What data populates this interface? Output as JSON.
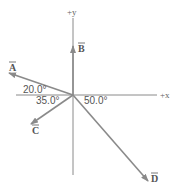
{
  "diagram": {
    "type": "vector-diagram",
    "origin": [
      73,
      95
    ],
    "colors": {
      "axis": "#8a8a8a",
      "vector": "#8a8a8a",
      "text": "#555555"
    },
    "axes": {
      "x_label": "+x",
      "y_label": "+y"
    },
    "vectors": [
      {
        "name": "A",
        "label": "A",
        "angle_label": "20.0°",
        "description": "20.0° above -x axis"
      },
      {
        "name": "B",
        "label": "B",
        "angle_label": "",
        "description": "along +y axis"
      },
      {
        "name": "C",
        "label": "C",
        "angle_label": "35.0°",
        "description": "35.0° below -x axis"
      },
      {
        "name": "D",
        "label": "D",
        "angle_label": "50.0°",
        "description": "50.0° below +x axis"
      }
    ],
    "angle_labels": {
      "a": "20.0°",
      "c": "35.0°",
      "d": "50.0°"
    }
  }
}
